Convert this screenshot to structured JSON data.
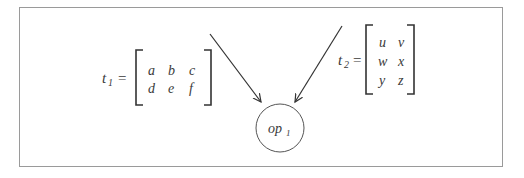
{
  "diagram": {
    "matrix_t1": {
      "name": "t",
      "subscript": "1",
      "equals": "=",
      "rows": [
        [
          "a",
          "b",
          "c"
        ],
        [
          "d",
          "e",
          "f"
        ]
      ]
    },
    "matrix_t2": {
      "name": "t",
      "subscript": "2",
      "equals": "=",
      "rows": [
        [
          "u",
          "v"
        ],
        [
          "w",
          "x"
        ],
        [
          "y",
          "z"
        ]
      ]
    },
    "operation_node": {
      "name": "op",
      "subscript": "1"
    },
    "edges": [
      {
        "from": "t1",
        "to": "op1"
      },
      {
        "from": "t2",
        "to": "op1"
      }
    ],
    "colors": {
      "frame": "#9a9a9a",
      "ink": "#333333"
    }
  }
}
